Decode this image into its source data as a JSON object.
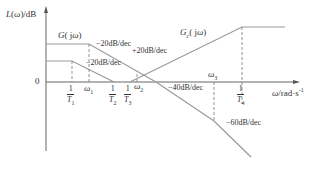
{
  "diagram": {
    "type": "bode-magnitude-asymptotic",
    "y_axis_label": "L(ω)/dB",
    "x_axis_label": "ω/rad·s⁻¹",
    "origin_label": "0",
    "curves": [
      {
        "name": "G(jω)",
        "label": "G( jω)"
      },
      {
        "name": "Gc(jω)",
        "label": "Gc( jω)"
      }
    ],
    "slope_labels": {
      "g_upper_first": "−20dB/dec",
      "g_lower": "−20dB/dec",
      "gc_rise": "+20dB/dec",
      "g_second": "−40dB/dec",
      "g_third": "−60dB/dec"
    },
    "frequency_marks": {
      "inv_T1": {
        "num": "1",
        "den": "T",
        "sub": "1"
      },
      "omega1": {
        "sym": "ω",
        "sub": "1"
      },
      "inv_T2": {
        "num": "1",
        "den": "T",
        "sub": "2"
      },
      "inv_T3": {
        "num": "1",
        "den": "T",
        "sub": "3"
      },
      "omega2": {
        "sym": "ω",
        "sub": "2"
      },
      "omega3": {
        "sym": "ω",
        "sub": "3"
      },
      "inv_T4": {
        "num": "1",
        "den": "T",
        "sub": "4"
      }
    },
    "colors": {
      "axis": "#555555",
      "curve": "#9a9a9a",
      "dashed": "#777777",
      "text": "#333333"
    }
  }
}
